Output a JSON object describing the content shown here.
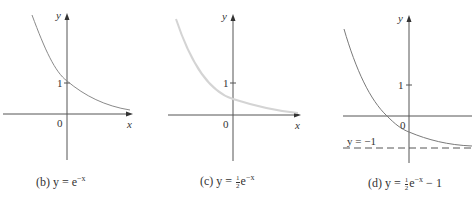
{
  "panels": [
    {
      "id": "b",
      "axis_y_label": "y",
      "axis_x_label": "x",
      "origin_label": "0",
      "tick_label": "1",
      "caption_prefix": "(b) y = e",
      "caption_exponent": "−x",
      "curve_color": "#8a8a8a"
    },
    {
      "id": "c",
      "axis_y_label": "y",
      "axis_x_label": "x",
      "origin_label": "0",
      "tick_label": "1",
      "caption_prefix": "(c) y = ",
      "caption_frac_num": "1",
      "caption_frac_den": "2",
      "caption_base": "e",
      "caption_exponent": "−x",
      "curve_color": "#d4d4d4"
    },
    {
      "id": "d",
      "axis_y_label": "y",
      "origin_label": "0",
      "tick_label": "1",
      "asymptote_label": "y = −1",
      "caption_prefix": "(d) y = ",
      "caption_frac_num": "1",
      "caption_frac_den": "2",
      "caption_base": "e",
      "caption_exponent": "−x",
      "caption_suffix": " − 1",
      "curve_color": "#7a7a7a"
    }
  ],
  "colors": {
    "axis": "#555555",
    "text": "#333333"
  }
}
